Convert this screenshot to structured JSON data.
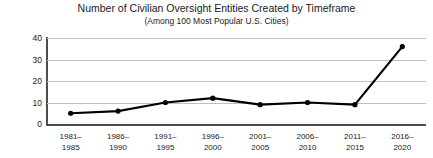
{
  "chart_data": {
    "type": "line",
    "title": "Number of Civilian Oversight Entities Created by Timeframe",
    "subtitle": "(Among 100 Most Popular U.S. Cities)",
    "xlabel": "",
    "ylabel": "",
    "ylim": [
      0,
      40
    ],
    "yticks": [
      40,
      30,
      20,
      10,
      0
    ],
    "grid": true,
    "legend": "none",
    "categories": [
      "1981–\n1985",
      "1986–\n1990",
      "1991–\n1995",
      "1996–\n2000",
      "2001–\n2005",
      "2006–\n2010",
      "2011–\n2015",
      "2016–\n2020"
    ],
    "category_lines": [
      {
        "top": "1981–",
        "bottom": "1985"
      },
      {
        "top": "1986–",
        "bottom": "1990"
      },
      {
        "top": "1991–",
        "bottom": "1995"
      },
      {
        "top": "1996–",
        "bottom": "2000"
      },
      {
        "top": "2001–",
        "bottom": "2005"
      },
      {
        "top": "2006–",
        "bottom": "2010"
      },
      {
        "top": "2011–",
        "bottom": "2015"
      },
      {
        "top": "2016–",
        "bottom": "2020"
      }
    ],
    "values": [
      5,
      6,
      10,
      12,
      9,
      10,
      9,
      36
    ],
    "series_color": "#000000",
    "marker_color": "#000000",
    "grid_color": "#bfbfbf",
    "axis_color": "#4d4d4d"
  }
}
